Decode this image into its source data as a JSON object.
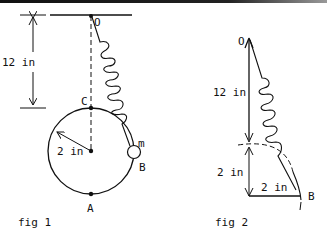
{
  "fig1": {
    "caption": "fig 1",
    "point_O": "O",
    "point_C": "C",
    "point_A": "A",
    "point_B": "B",
    "mass_label": "m",
    "dim_vertical": "12 in",
    "dim_radius": "2 in"
  },
  "fig2": {
    "caption": "fig 2",
    "point_O": "O",
    "point_B": "B",
    "dim_vertical_long": "12 in",
    "dim_vertical_short": "2 in",
    "dim_horizontal": "2 in"
  },
  "colors": {
    "ink": "#111111",
    "background": "#ffffff"
  }
}
